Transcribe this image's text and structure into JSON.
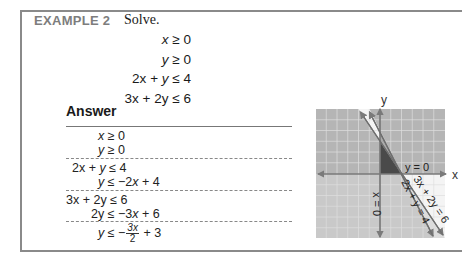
{
  "example": {
    "label": "EXAMPLE 2",
    "instruction": "Solve."
  },
  "problem": {
    "inequalities": [
      {
        "lhs_coef": "x",
        "op": "≥",
        "rhs": "0"
      },
      {
        "lhs_coef": "y",
        "op": "≥",
        "rhs": "0"
      },
      {
        "lhs_a": "2x",
        "plus": "+",
        "lhs_b": "y",
        "op": "≤",
        "rhs": "4"
      },
      {
        "lhs_a": "3x",
        "plus": "+",
        "lhs_b": "2y",
        "op": "≤",
        "rhs": "6"
      }
    ]
  },
  "answer": {
    "title": "Answer",
    "steps": [
      {
        "var": "x",
        "rest": " ≥ 0"
      },
      {
        "var": "y",
        "rest": " ≥ 0"
      },
      {
        "a": "2x",
        "mid": " + ",
        "b": "y",
        "rest": " ≤ 4"
      },
      {
        "var": "y",
        "rest": " ≤ −2",
        "var2": "x",
        "rest2": " + 4"
      },
      {
        "a": "3x",
        "mid": " + ",
        "b": "2y",
        "rest": " ≤ 6"
      },
      {
        "var": "2y",
        "rest": " ≤ −3",
        "var2": "x",
        "rest2": " + 6"
      },
      {
        "var": "y",
        "rest": " ≤ −",
        "frac_num": "3x",
        "frac_den": "2",
        "rest2": " + 3"
      }
    ]
  },
  "graph": {
    "x_axis_label": "x",
    "y_axis_label": "y",
    "line_labels": {
      "y_zero": "y = 0",
      "x_zero": "x = 0",
      "line1": "2x + y = 4",
      "line2": "3x + 2y = 6"
    },
    "colors": {
      "upper_gray": "#b5b5b5",
      "lower_gray": "#c9c9c9",
      "white_region": "#f4f4f4",
      "solution_region": "#4a4a4a",
      "grid": "#e2e2e2",
      "axis": "#7a7a7a",
      "line": "#6e6e6e"
    }
  }
}
